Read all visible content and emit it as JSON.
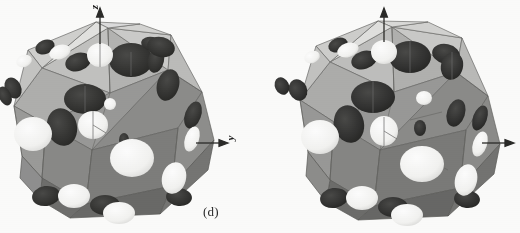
{
  "figure": {
    "background_color": "#fdfdfc",
    "width": 520,
    "height": 233,
    "panels": [
      {
        "id": "d",
        "caption": "(d)",
        "subject": "perforated icosahedral polyhedron shell",
        "axes": [
          {
            "name": "z-axis",
            "label": "z",
            "direction": "up",
            "orientation": "vertical"
          },
          {
            "name": "y-axis",
            "label": "y",
            "direction": "right",
            "orientation": "horizontal"
          }
        ],
        "colors": {
          "face_light": "#c8c8c6",
          "face_mid": "#a6a6a4",
          "face_dark": "#8b8b89",
          "face_darker": "#757573",
          "hole_dark": "#3a3a38",
          "hole_open": "#f7f7f5",
          "edge": "#5a5a58",
          "axis": "#2a2a28"
        }
      },
      {
        "id": "c",
        "caption": "(c)",
        "subject": "perforated icosahedral polyhedron shell",
        "axes": [
          {
            "name": "z-axis",
            "label": "z",
            "direction": "up",
            "orientation": "vertical"
          },
          {
            "name": "y-axis",
            "label": "y",
            "direction": "right",
            "orientation": "horizontal"
          }
        ],
        "colors": {
          "face_light": "#c8c8c6",
          "face_mid": "#a6a6a4",
          "face_dark": "#8b8b89",
          "face_darker": "#757573",
          "hole_dark": "#3a3a38",
          "hole_open": "#f7f7f5",
          "edge": "#5a5a58",
          "axis": "#2a2a28"
        }
      }
    ]
  }
}
